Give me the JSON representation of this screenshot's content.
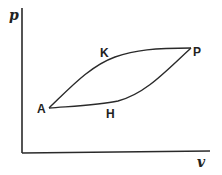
{
  "diagram": {
    "type": "pressure-volume cycle diagram",
    "axes": {
      "y_label": "p",
      "x_label": "v"
    },
    "points": [
      {
        "id": "A",
        "label": "A"
      },
      {
        "id": "K",
        "label": "K"
      },
      {
        "id": "P",
        "label": "P"
      },
      {
        "id": "H",
        "label": "H"
      }
    ],
    "curves": [
      {
        "name": "upper-curve",
        "path": "A-K-P"
      },
      {
        "name": "lower-curve",
        "path": "A-H-P"
      }
    ]
  }
}
